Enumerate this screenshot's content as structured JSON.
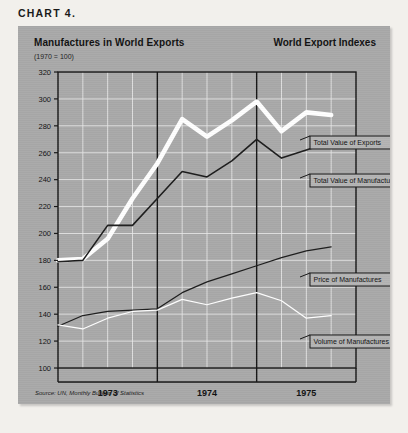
{
  "chart_label": "CHART  4.",
  "panel": {
    "title_main": "Manufactures in World Exports",
    "title_sub": "(1970 = 100)",
    "title_right": "World Export Indexes",
    "source": "Source: UN, Monthly Bulletin of Statistics"
  },
  "chart_data": {
    "type": "line",
    "title": "Manufactures in World Exports",
    "subtitle": "(1970 = 100)",
    "right_title": "World Export Indexes",
    "xlabel": "",
    "ylabel": "",
    "ylim": [
      100,
      320
    ],
    "ytick_step": 20,
    "yticks": [
      100,
      120,
      140,
      160,
      180,
      200,
      220,
      240,
      260,
      280,
      300,
      320
    ],
    "xlim": [
      0,
      24
    ],
    "xticks": [
      4,
      12,
      20
    ],
    "xtick_labels": [
      "1973",
      "1974",
      "1975"
    ],
    "year_dividers": [
      8,
      16
    ],
    "grid": true,
    "legend_position": "right-inline-callouts",
    "x": [
      0,
      2,
      4,
      6,
      8,
      10,
      12,
      14,
      16,
      18,
      20,
      22
    ],
    "series": [
      {
        "name": "Total Value of Exports",
        "color": "#ffffff",
        "width": "thick",
        "values": [
          180,
          181,
          196,
          226,
          252,
          285,
          272,
          284,
          298,
          276,
          290,
          288
        ]
      },
      {
        "name": "Total Value of Manufactures",
        "color": "#1c1c1c",
        "width": "medium",
        "values": [
          179,
          180,
          206,
          206,
          226,
          246,
          242,
          254,
          270,
          256,
          262,
          268
        ]
      },
      {
        "name": "Price of Manufactures",
        "color": "#1c1c1c",
        "width": "thin",
        "values": [
          131,
          139,
          142,
          143,
          144,
          156,
          164,
          170,
          176,
          182,
          187,
          190
        ]
      },
      {
        "name": "Volume of Manufactures",
        "color": "#ffffff",
        "width": "thin",
        "values": [
          132,
          129,
          137,
          142,
          143,
          151,
          147,
          152,
          156,
          150,
          137,
          139
        ]
      }
    ]
  },
  "callouts": [
    {
      "label": "Total Value of Exports",
      "x": 292,
      "y": 110
    },
    {
      "label": "Total Value of Manufactures",
      "x": 292,
      "y": 148
    },
    {
      "label": "Price of Manufactures",
      "x": 292,
      "y": 247
    },
    {
      "label": "Volume of Manufactures",
      "x": 292,
      "y": 309
    }
  ],
  "colors": {
    "panel_bg": "#a9a9a9",
    "page_bg": "#f2f0ec",
    "grid": "#e8e8e8",
    "axis": "#161616",
    "light_series": "#ffffff",
    "dark_series": "#1c1c1c",
    "callout_bg": "#b4b4b4"
  }
}
